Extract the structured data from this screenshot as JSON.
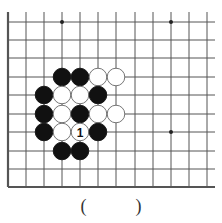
{
  "diagram": {
    "type": "go-board-problem",
    "grid": {
      "x_lines": [
        8,
        26,
        44,
        62,
        80,
        98,
        116,
        135,
        153,
        171,
        189,
        207
      ],
      "y_lines": [
        22,
        40,
        58,
        77,
        95,
        114,
        132,
        151,
        169,
        187
      ],
      "extend_right": 215,
      "extend_top": 12,
      "edges": [
        "left",
        "bottom"
      ]
    },
    "star_points": [
      [
        3,
        0
      ],
      [
        9,
        0
      ],
      [
        9,
        6
      ]
    ],
    "stones": [
      {
        "col": 3,
        "row": 3,
        "color": "black"
      },
      {
        "col": 4,
        "row": 3,
        "color": "black"
      },
      {
        "col": 5,
        "row": 3,
        "color": "white"
      },
      {
        "col": 6,
        "row": 3,
        "color": "white"
      },
      {
        "col": 2,
        "row": 4,
        "color": "black"
      },
      {
        "col": 3,
        "row": 4,
        "color": "white"
      },
      {
        "col": 4,
        "row": 4,
        "color": "white"
      },
      {
        "col": 5,
        "row": 4,
        "color": "black"
      },
      {
        "col": 2,
        "row": 5,
        "color": "black"
      },
      {
        "col": 3,
        "row": 5,
        "color": "white"
      },
      {
        "col": 4,
        "row": 5,
        "color": "black"
      },
      {
        "col": 5,
        "row": 5,
        "color": "white"
      },
      {
        "col": 6,
        "row": 5,
        "color": "white"
      },
      {
        "col": 2,
        "row": 6,
        "color": "black"
      },
      {
        "col": 3,
        "row": 6,
        "color": "white"
      },
      {
        "col": 4,
        "row": 6,
        "color": "white",
        "label": "1"
      },
      {
        "col": 5,
        "row": 6,
        "color": "black"
      },
      {
        "col": 3,
        "row": 7,
        "color": "black"
      },
      {
        "col": 4,
        "row": 7,
        "color": "black"
      }
    ]
  },
  "answer": {
    "open": "(",
    "blank": "",
    "close": ")"
  },
  "colors": {
    "line": "#555555",
    "black_stone": "#111111",
    "white_stone": "#ffffff"
  }
}
